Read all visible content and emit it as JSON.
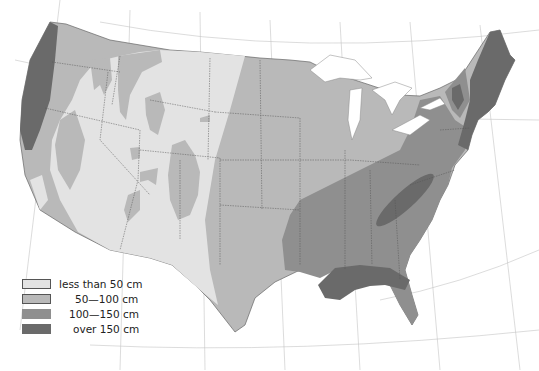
{
  "map": {
    "subject": "Average annual precipitation, United States",
    "colors": {
      "background": "#ffffff",
      "water": "#ffffff",
      "class1": "#e3e3e3",
      "class2": "#b9b9b9",
      "class3": "#8f8f8f",
      "class4": "#6a6a6a",
      "boundary": "#555555",
      "graticule": "#bdbdbd"
    }
  },
  "legend": {
    "items": [
      {
        "label": "less than 50 cm",
        "color": "#e3e3e3"
      },
      {
        "label": "50—100 cm",
        "color": "#b9b9b9"
      },
      {
        "label": "100—150 cm",
        "color": "#8f8f8f"
      },
      {
        "label": "over 150 cm",
        "color": "#6a6a6a"
      }
    ]
  }
}
